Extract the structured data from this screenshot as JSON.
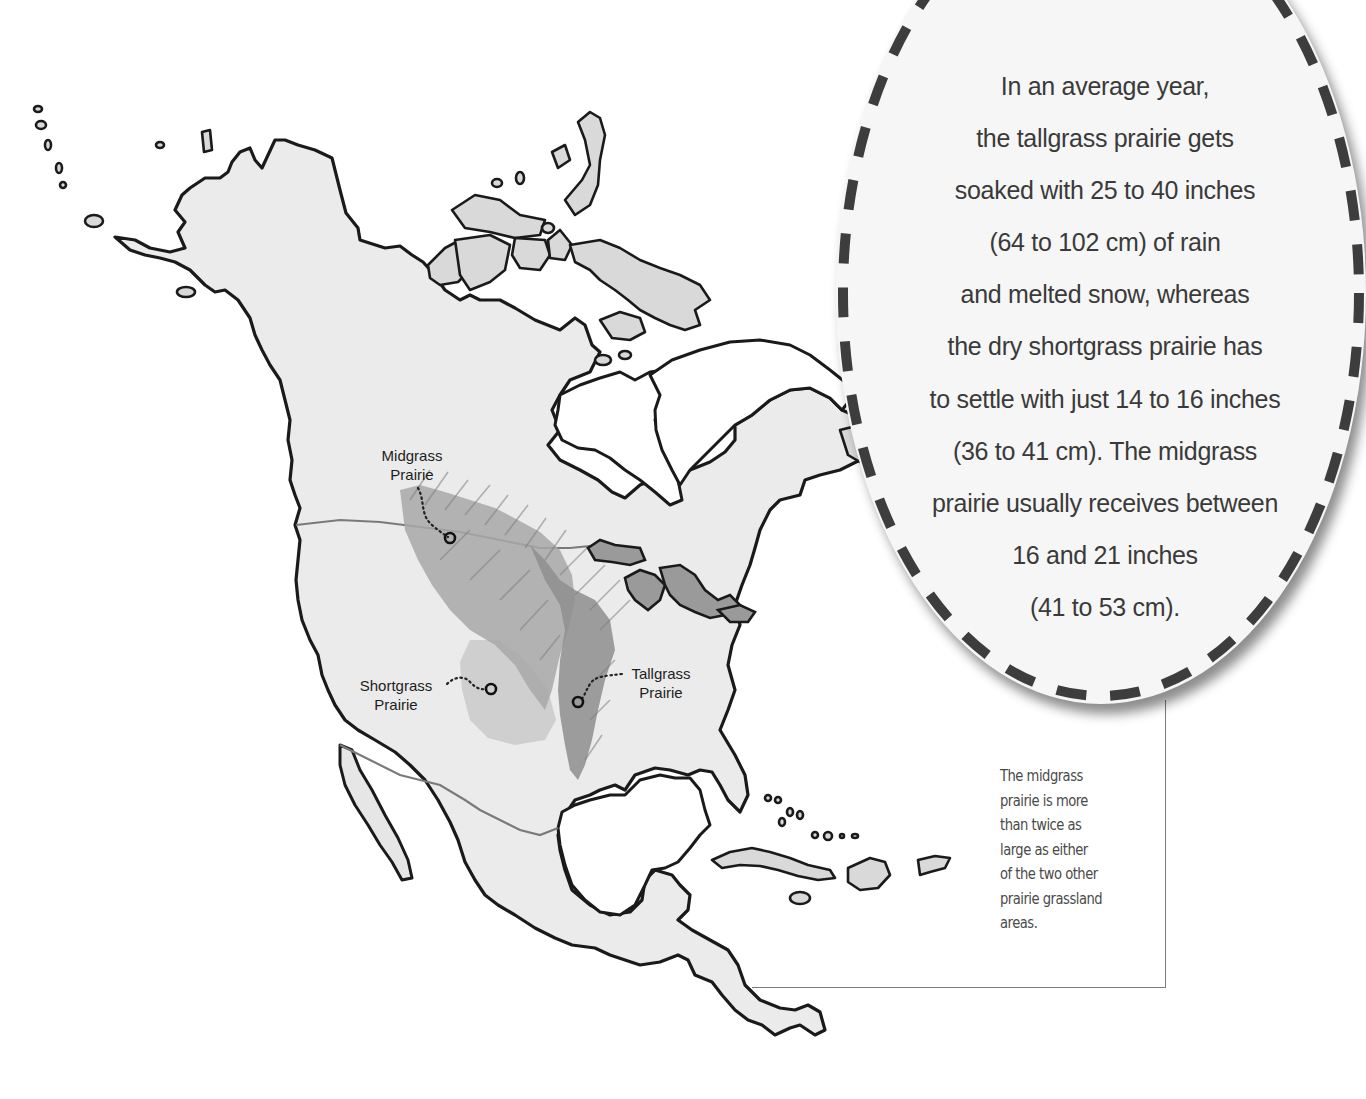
{
  "map": {
    "region": "North America",
    "labels": {
      "midgrass": [
        "Midgrass",
        "Prairie"
      ],
      "shortgrass": [
        "Shortgrass",
        "Prairie"
      ],
      "tallgrass": [
        "Tallgrass",
        "Prairie"
      ]
    },
    "colors": {
      "land": "#ebebeb",
      "coastline": "#1a1a1a",
      "midgrass": "#a8a8a8",
      "tallgrass": "#8e8e8e",
      "shortgrass": "#c8c8c8",
      "callout_dash": "#3d3d3d"
    }
  },
  "callout": {
    "lines": [
      "In an average year,",
      "the tallgrass prairie gets",
      "soaked with 25 to 40 inches",
      "(64 to 102 cm) of rain",
      "and melted snow, whereas",
      "the dry shortgrass prairie has",
      "to settle with just 14 to 16 inches",
      "(36 to 41 cm). The midgrass",
      "prairie usually receives between",
      "16 and 21 inches",
      "(41 to 53 cm)."
    ]
  },
  "note": {
    "lines": [
      "The midgrass",
      "prairie is more",
      "than twice as",
      "large as either",
      "of the two other",
      "prairie grassland",
      "areas."
    ]
  }
}
